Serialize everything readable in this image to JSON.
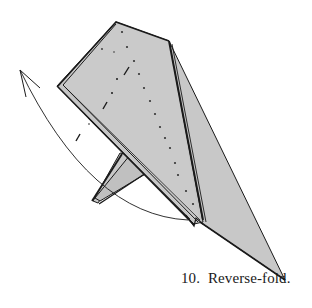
{
  "figure": {
    "step_number": "10.",
    "caption": "Reverse-fold.",
    "paper_color": "#c8c8c8",
    "line_color": "#1a1a1a",
    "background": "#ffffff"
  },
  "elements": {
    "model": "origami-model",
    "arrow": "curved-reverse-fold-arrow",
    "valley_line": "dash-dot-fold-line",
    "mountain_line": "dotted-fold-line"
  }
}
